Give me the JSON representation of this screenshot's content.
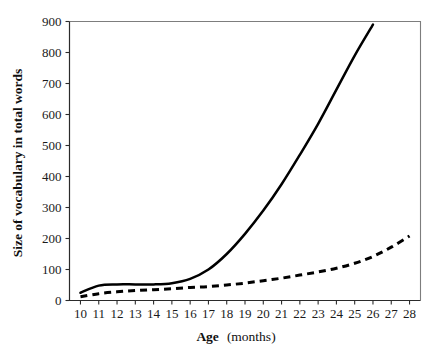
{
  "chart_data": {
    "type": "line",
    "title": "",
    "xlabel_bold": "Age",
    "xlabel_rest": " (months)",
    "ylabel": "Size of vocabulary in total words",
    "xlim": [
      9.4,
      28.6
    ],
    "ylim": [
      0,
      900
    ],
    "grid": false,
    "legend": "none",
    "x_ticks": [
      10,
      11,
      12,
      13,
      14,
      15,
      16,
      17,
      18,
      19,
      20,
      21,
      22,
      23,
      24,
      25,
      26,
      27,
      28
    ],
    "y_ticks": [
      0,
      100,
      200,
      300,
      400,
      500,
      600,
      700,
      800,
      900
    ],
    "x": [
      10,
      11,
      12,
      13,
      14,
      15,
      16,
      17,
      18,
      19,
      20,
      21,
      22,
      23,
      24,
      25,
      26,
      27,
      28
    ],
    "series": [
      {
        "name": "solid-curve",
        "style": "solid",
        "color": "#000000",
        "x": [
          10,
          11,
          12,
          13,
          14,
          15,
          16,
          17,
          18,
          19,
          20,
          21,
          22,
          23,
          24,
          25,
          26
        ],
        "values": [
          25,
          48,
          52,
          52,
          52,
          56,
          70,
          100,
          150,
          215,
          290,
          375,
          470,
          570,
          680,
          790,
          890
        ]
      },
      {
        "name": "dashed-curve",
        "style": "dashed",
        "color": "#000000",
        "x": [
          10,
          11,
          12,
          13,
          14,
          15,
          16,
          17,
          18,
          19,
          20,
          21,
          22,
          23,
          24,
          25,
          26,
          27,
          28
        ],
        "values": [
          12,
          22,
          28,
          32,
          35,
          38,
          42,
          45,
          50,
          56,
          64,
          72,
          82,
          92,
          104,
          120,
          142,
          172,
          208
        ]
      }
    ]
  },
  "axes": {
    "y_title": "Size of vocabulary in total words",
    "x_title_bold": "Age",
    "x_title_rest": "(months)"
  }
}
